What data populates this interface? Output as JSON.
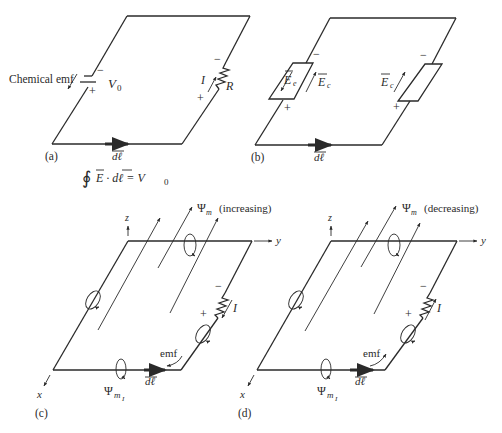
{
  "panels": {
    "a": {
      "label": "(a)",
      "chemical_emf": "Chemical emf",
      "source_voltage": "V",
      "source_voltage_sub": "0",
      "current": "I",
      "resistor": "R",
      "minus": "−",
      "plus": "+",
      "dl": "dℓ",
      "equation": {
        "integral": "∮",
        "lhs": "E · dℓ = V",
        "sub": "0"
      }
    },
    "b": {
      "label": "(b)",
      "field_e": "E",
      "field_e_sub": "e",
      "field_c": "E",
      "field_c_sub": "c",
      "minus": "−",
      "plus": "+",
      "dl": "dℓ"
    },
    "c": {
      "label": "(c)",
      "flux": "Ψ",
      "flux_sub": "m",
      "flux_state": "(increasing)",
      "axis_x": "x",
      "axis_y": "y",
      "axis_z": "z",
      "current": "I",
      "emf": "emf",
      "induced_flux": "Ψ",
      "induced_flux_sub": "m",
      "induced_flux_subsub": "I",
      "minus": "−",
      "plus": "+",
      "dl": "dℓ"
    },
    "d": {
      "label": "(d)",
      "flux": "Ψ",
      "flux_sub": "m",
      "flux_state": "(decreasing)",
      "axis_x": "x",
      "axis_y": "y",
      "axis_z": "z",
      "current": "I",
      "emf": "emf",
      "induced_flux": "Ψ",
      "induced_flux_sub": "m",
      "induced_flux_subsub": "I",
      "minus": "−",
      "plus": "+",
      "dl": "dℓ"
    }
  }
}
